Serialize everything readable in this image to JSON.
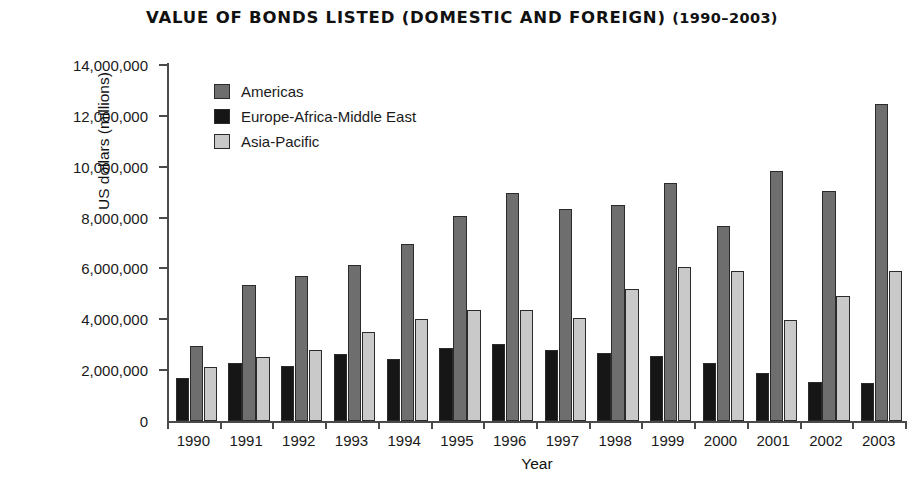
{
  "chart_data": {
    "type": "bar",
    "title": "VALUE OF BONDS LISTED (DOMESTIC AND FOREIGN) (1990–2003)",
    "title_main": "VALUE OF BONDS LISTED (DOMESTIC AND FOREIGN)",
    "title_years": "(1990–2003)",
    "xlabel": "Year",
    "ylabel": "US dollars (millions)",
    "ylim": [
      0,
      14000000
    ],
    "ytick_labels": [
      "14,000,000",
      "12,000,000",
      "10,000,000",
      "8,000,000",
      "6,000,000",
      "4,000,000",
      "2,000,000",
      "0"
    ],
    "ytick_values": [
      14000000,
      12000000,
      10000000,
      8000000,
      6000000,
      4000000,
      2000000,
      0
    ],
    "ytick_interval": 2000000,
    "grid": false,
    "legend_position": "upper-left-inside",
    "categories": [
      "1990",
      "1991",
      "1992",
      "1993",
      "1994",
      "1995",
      "1996",
      "1997",
      "1998",
      "1999",
      "2000",
      "2001",
      "2002",
      "2003"
    ],
    "series": [
      {
        "name": "Americas",
        "color": "#6e6e6e",
        "values": [
          2950000,
          5350000,
          5700000,
          6150000,
          6950000,
          8050000,
          8950000,
          8350000,
          8500000,
          9350000,
          7650000,
          9850000,
          9050000,
          12450000
        ]
      },
      {
        "name": "Europe-Africa-Middle East",
        "color": "#161616",
        "values": [
          1680000,
          2300000,
          2150000,
          2650000,
          2450000,
          2870000,
          3020000,
          2800000,
          2680000,
          2570000,
          2280000,
          1870000,
          1550000,
          1480000
        ]
      },
      {
        "name": "Asia-Pacific",
        "color": "#c9c9c9",
        "values": [
          2120000,
          2500000,
          2800000,
          3500000,
          4000000,
          4350000,
          4350000,
          4050000,
          5200000,
          6050000,
          5880000,
          3970000,
          4900000,
          5880000
        ]
      }
    ]
  }
}
